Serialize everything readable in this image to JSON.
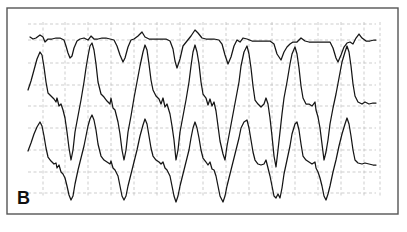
{
  "figure": {
    "panel_label": "B",
    "frame": {
      "x": 7,
      "y": 8,
      "w": 391,
      "h": 206
    },
    "colors": {
      "frame": "#555555",
      "grid": "#b8b8b8",
      "trace": "#151515",
      "background": "#ffffff"
    },
    "grid": {
      "vertical_x": [
        43,
        65,
        88,
        111,
        134,
        157,
        180,
        203,
        226,
        249,
        272,
        295,
        318,
        341,
        364,
        380
      ],
      "horizontal_y": [
        24,
        40,
        63,
        85,
        106,
        128,
        150,
        172,
        193
      ],
      "x_range": [
        28,
        376
      ],
      "y_range": [
        22,
        196
      ]
    },
    "traces": [
      {
        "name": "top-trace",
        "points": "30,37 33,39 36,38 40,35 43,37 45,42 48,39 52,39 56,38 60,38 64,40 66,46 68,53 70,58 72,56 74,48 77,41 80,39 84,38 88,40 91,36 94,39 98,39 102,38 106,38 110,39 114,40 117,46 120,55 123,62 125,58 128,47 131,40 134,39 138,36 142,32 145,37 149,39 154,39 158,39 162,39 166,39 170,41 173,49 175,61 177,68 180,59 183,46 187,41 191,36 195,30 198,33 202,38 206,39 210,39 214,39 219,40 222,44 225,55 228,64 231,57 234,46 237,40 240,42 243,38 247,39 252,41 256,41 261,41 266,41 270,41 274,44 277,54 281,60 284,52 287,47 290,44 293,42 297,42 301,38 305,41 309,42 314,42 318,42 322,42 326,42 330,42 333,48 336,58 338,62 341,55 344,47 347,43 350,42 353,44 356,38 359,34 362,38 366,41 370,41 374,40 376,40"
      },
      {
        "name": "middle-trace",
        "points": "28,90 31,81 34,70 37,59 40,52 42,55 44,67 46,82 48,93 51,96 54,99 56,102 57,98 59,106 61,104 63,110 65,118 67,132 69,148 71,160 73,150 75,132 78,116 81,100 84,82 86,68 88,56 90,46 92,43 94,50 96,64 98,82 101,94 104,97 107,101 110,104 111,98 113,108 115,110 118,122 120,134 122,150 124,160 126,150 128,132 131,116 134,98 137,82 140,66 143,52 145,45 147,50 149,64 151,80 153,90 156,96 159,99 161,104 163,98 165,107 167,104 170,114 172,126 174,140 176,160 178,150 180,132 183,116 186,100 189,82 191,66 193,52 195,45 197,52 199,64 201,82 203,94 206,98 208,105 210,99 212,106 214,102 216,111 218,126 220,141 223,154 225,160 227,146 230,130 233,114 236,98 239,82 241,66 244,52 247,46 249,54 251,68 253,86 255,100 258,104 261,107 264,104 266,98 268,104 270,118 272,136 274,156 276,167 278,150 280,132 282,114 284,98 287,82 290,64 292,54 295,47 297,54 299,68 301,86 303,98 306,104 309,104 312,106 315,102 316,110 318,117 320,128 322,144 324,160 326,152 328,140 330,124 333,108 336,94 339,78 342,62 345,52 347,46 349,52 351,66 353,84 355,96 358,102 362,104 365,102 369,104 373,103 376,103"
      },
      {
        "name": "bottom-trace",
        "points": "28,151 31,143 34,134 37,127 40,122 42,126 44,136 46,148 48,157 51,161 54,164 56,163 57,168 59,165 61,172 63,174 65,178 67,186 69,195 71,200 73,196 75,184 78,170 81,158 84,146 86,136 88,126 90,119 92,115 94,120 96,130 98,144 101,156 104,160 107,162 110,164 111,161 113,168 115,170 118,176 120,186 122,196 124,200 126,196 128,186 131,174 134,162 137,150 140,136 143,125 145,119 147,124 149,136 151,148 153,156 156,160 159,162 161,164 163,162 165,168 167,170 170,176 172,186 174,196 176,202 178,196 180,186 183,174 186,162 189,150 191,138 193,128 195,122 197,128 199,138 201,150 203,158 206,162 208,165 210,162 212,169 214,170 216,176 218,186 220,196 223,202 225,196 227,186 230,174 233,162 236,150 239,138 241,128 244,122 247,120 249,128 251,140 253,152 255,160 258,164 261,165 264,164 266,160 268,168 270,176 272,186 274,196 276,198 278,194 280,198 282,188 284,174 287,160 290,146 292,134 295,124 297,122 299,130 301,144 303,156 306,160 309,162 312,164 315,162 316,168 318,172 320,178 322,186 324,196 326,200 328,194 330,186 333,172 336,160 339,146 342,134 345,124 347,118 349,124 351,136 353,150 355,160 358,163 362,164 365,163 369,164 373,165 376,165"
      }
    ]
  }
}
